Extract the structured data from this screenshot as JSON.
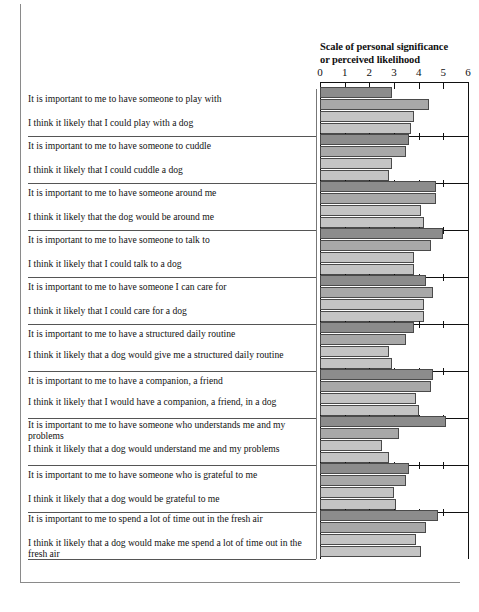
{
  "figure": {
    "axis_title_line1": "Scale of personal significance",
    "axis_title_line2": "or perceived likelihood"
  },
  "chart_data": {
    "type": "bar",
    "orientation": "horizontal",
    "title": "Scale of personal significance or perceived likelihood",
    "xlabel": "Scale of personal significance or perceived likelihood",
    "ylabel": "",
    "xlim": [
      0,
      6
    ],
    "xticks": [
      0,
      1,
      2,
      3,
      4,
      5,
      6
    ],
    "xtick_labels": [
      "0",
      "1",
      "2",
      "3",
      "4",
      "5",
      "6"
    ],
    "grid": false,
    "legend": "none",
    "bars_per_group": 3,
    "series": [
      {
        "name": "group-bar-1",
        "color": "#8c8c8c"
      },
      {
        "name": "group-bar-2",
        "color": "#a8a8a8"
      },
      {
        "name": "group-bar-3",
        "color": "#c4c4c4"
      }
    ],
    "categories": [
      "It is important to me to have someone to play with",
      "I think it likely that I could play with a dog",
      "It is important to me to have someone to cuddle",
      "I think it likely that I could cuddle a dog",
      "It is important to me to have someone around me",
      "I think it likely that the dog would be around me",
      "It is important to me to have someone to talk to",
      "I think it likely that I could talk to a dog",
      "It is important to me to have someone I can care for",
      "I think it likely that I could care for a dog",
      "It is important to me to have a structured daily routine",
      "I think it likely that a dog would give me a structured daily routine",
      "It is important to me to have a companion, a friend",
      "I think it likely that I would have a companion, a friend, in a dog",
      "It is important to me to have someone who understands me and my problems",
      "I think it likely that a dog would understand me and my problems",
      "It is important to me to have someone who is grateful to me",
      "I think it likely that a dog would be grateful to me",
      "It is important to me to spend a lot of time out in the fresh air",
      "I think it likely that a dog would make me spend a lot of time out in the fresh air"
    ],
    "groups": [
      {
        "label": "play",
        "values": [
          2.9,
          4.4,
          3.8,
          3.7
        ]
      },
      {
        "label": "cuddle",
        "values": [
          3.6,
          3.5,
          2.9,
          2.8
        ]
      },
      {
        "label": "around me",
        "values": [
          4.7,
          4.7,
          4.1,
          4.2
        ]
      },
      {
        "label": "talk to",
        "values": [
          5.0,
          4.5,
          3.8,
          3.8
        ]
      },
      {
        "label": "care for",
        "values": [
          4.3,
          4.6,
          4.2,
          4.2
        ]
      },
      {
        "label": "daily routine",
        "values": [
          3.8,
          3.5,
          2.8,
          2.9
        ]
      },
      {
        "label": "companion",
        "values": [
          4.6,
          4.5,
          3.9,
          4.0
        ]
      },
      {
        "label": "understands me",
        "values": [
          5.1,
          3.2,
          2.5,
          2.8
        ]
      },
      {
        "label": "grateful",
        "values": [
          3.6,
          3.5,
          3.0,
          3.1
        ]
      },
      {
        "label": "fresh air",
        "values": [
          4.8,
          4.3,
          3.9,
          4.1
        ]
      }
    ]
  }
}
